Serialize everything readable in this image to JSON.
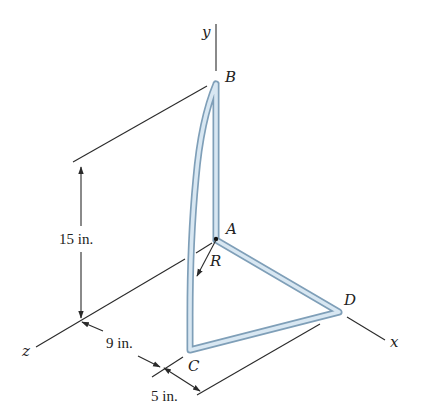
{
  "figure": {
    "axes": {
      "y": "y",
      "x": "x",
      "z": "z"
    },
    "points": {
      "A": "A",
      "B": "B",
      "C": "C",
      "D": "D",
      "R": "R"
    },
    "dimensions": {
      "height": "15 in.",
      "depth": "9 in.",
      "offset": "5 in."
    },
    "colors": {
      "rod_outline": "#7f9fb8",
      "rod_fill": "#d8e7f2",
      "line": "#2a2a2a"
    }
  }
}
